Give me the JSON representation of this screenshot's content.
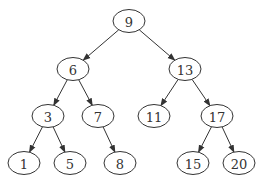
{
  "diagram": {
    "type": "binary-search-tree",
    "nodes": [
      {
        "id": "n9",
        "label": "9",
        "x": 129,
        "y": 21
      },
      {
        "id": "n6",
        "label": "6",
        "x": 73,
        "y": 69
      },
      {
        "id": "n13",
        "label": "13",
        "x": 185,
        "y": 69
      },
      {
        "id": "n3",
        "label": "3",
        "x": 48,
        "y": 116
      },
      {
        "id": "n7",
        "label": "7",
        "x": 98,
        "y": 116
      },
      {
        "id": "n11",
        "label": "11",
        "x": 154,
        "y": 116
      },
      {
        "id": "n17",
        "label": "17",
        "x": 217,
        "y": 116
      },
      {
        "id": "n1",
        "label": "1",
        "x": 24,
        "y": 163
      },
      {
        "id": "n5",
        "label": "5",
        "x": 70,
        "y": 163
      },
      {
        "id": "n8",
        "label": "8",
        "x": 120,
        "y": 163
      },
      {
        "id": "n15",
        "label": "15",
        "x": 193,
        "y": 163
      },
      {
        "id": "n20",
        "label": "20",
        "x": 239,
        "y": 163
      }
    ],
    "edges": [
      [
        "n9",
        "n6"
      ],
      [
        "n9",
        "n13"
      ],
      [
        "n6",
        "n3"
      ],
      [
        "n6",
        "n7"
      ],
      [
        "n13",
        "n11"
      ],
      [
        "n13",
        "n17"
      ],
      [
        "n3",
        "n1"
      ],
      [
        "n3",
        "n5"
      ],
      [
        "n7",
        "n8"
      ],
      [
        "n17",
        "n15"
      ],
      [
        "n17",
        "n20"
      ]
    ],
    "colors": {
      "stroke": "#333333",
      "fill": "#ffffff"
    }
  }
}
